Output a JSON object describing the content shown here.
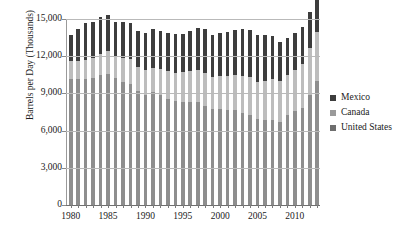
{
  "chart_data": {
    "type": "bar",
    "stacked": true,
    "title": "",
    "xlabel": "",
    "ylabel": "Barrels per Day (Thousands)",
    "ylim": [
      0,
      15000
    ],
    "ytick_values": [
      0,
      3000,
      6000,
      9000,
      12000,
      15000
    ],
    "ytick_labels": [
      "0",
      "3,000",
      "6,000",
      "9,000",
      "12,000",
      "15,000"
    ],
    "grid": true,
    "legend_position": "right",
    "legend": [
      "Mexico",
      "Canada",
      "United States"
    ],
    "categories": [
      "1980",
      "1981",
      "1982",
      "1983",
      "1984",
      "1985",
      "1986",
      "1987",
      "1988",
      "1989",
      "1990",
      "1991",
      "1992",
      "1993",
      "1994",
      "1995",
      "1996",
      "1997",
      "1998",
      "1999",
      "2000",
      "2001",
      "2002",
      "2003",
      "2004",
      "2005",
      "2006",
      "2007",
      "2008",
      "2009",
      "2010",
      "2011",
      "2012",
      "2013"
    ],
    "xtick_labels": [
      "1980",
      "1985",
      "1990",
      "1995",
      "2000",
      "2005",
      "2010"
    ],
    "xtick_categories": [
      "1980",
      "1985",
      "1990",
      "1995",
      "2000",
      "2005",
      "2010"
    ],
    "series": [
      {
        "name": "United States",
        "color": "#8e8e8e",
        "values": [
          10170,
          10180,
          10200,
          10250,
          10510,
          10580,
          10230,
          9940,
          9760,
          9160,
          8910,
          9080,
          8870,
          8580,
          8390,
          8320,
          8290,
          8270,
          8010,
          7730,
          7730,
          7670,
          7630,
          7400,
          7230,
          6900,
          6840,
          6860,
          6730,
          7270,
          7550,
          7860,
          8900,
          10000
        ]
      },
      {
        "name": "Canada",
        "color": "#bdbdbd",
        "values": [
          1440,
          1440,
          1460,
          1570,
          1690,
          1810,
          1810,
          1920,
          1980,
          1950,
          1970,
          1980,
          2070,
          2190,
          2280,
          2400,
          2480,
          2590,
          2670,
          2600,
          2700,
          2760,
          2860,
          3000,
          3080,
          3040,
          3180,
          3310,
          3280,
          3230,
          3340,
          3520,
          3740,
          3970
        ]
      },
      {
        "name": "Mexico",
        "color": "#3d3d3d",
        "values": [
          2130,
          2550,
          3000,
          2930,
          2980,
          2920,
          2740,
          2880,
          2910,
          2900,
          2970,
          3130,
          3090,
          3130,
          3130,
          3070,
          3280,
          3410,
          3500,
          3350,
          3460,
          3560,
          3590,
          3790,
          3830,
          3760,
          3710,
          3480,
          3160,
          2980,
          2960,
          2940,
          2910,
          2880
        ]
      }
    ]
  },
  "axis": {
    "y_title": "Barrels per Day (Thousands)"
  }
}
